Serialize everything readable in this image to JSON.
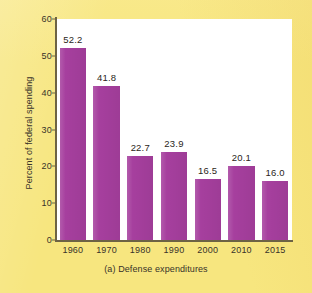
{
  "chart_data": {
    "type": "bar",
    "title": "",
    "caption": "(a) Defense expenditures",
    "xlabel": "",
    "ylabel": "Percent of federal spending",
    "categories": [
      "1960",
      "1970",
      "1980",
      "1990",
      "2000",
      "2010",
      "2015"
    ],
    "values": [
      52.2,
      41.8,
      22.7,
      23.9,
      16.5,
      20.1,
      16.0
    ],
    "value_labels": [
      "52.2",
      "41.8",
      "22.7",
      "23.9",
      "16.5",
      "20.1",
      "16.0"
    ],
    "ylim": [
      0,
      60
    ],
    "y_ticks": [
      0,
      10,
      20,
      30,
      40,
      50,
      60
    ],
    "y_tick_labels": [
      "0",
      "10",
      "20",
      "30",
      "40",
      "50",
      "60"
    ],
    "grid": false,
    "legend": null,
    "series": [
      {
        "name": "Defense expenditures",
        "values": [
          52.2,
          41.8,
          22.7,
          23.9,
          16.5,
          20.1,
          16.0
        ]
      }
    ]
  },
  "colors": {
    "page_background": "#f7e67f",
    "plot_background": "#ffffff",
    "bar_fill": "#a63f9e",
    "axis_line": "#6d6344",
    "text": "#38332a"
  }
}
